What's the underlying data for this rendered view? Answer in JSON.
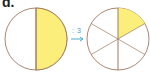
{
  "label": "d.",
  "operation": ": 3",
  "colors": {
    "fill": "#fbee7a",
    "stroke": "#a07860",
    "arrow": "#3aa6c9",
    "background": "#ffffff"
  },
  "left_circle": {
    "divisions": 2,
    "shaded": 1,
    "fraction": "1/2"
  },
  "right_circle": {
    "divisions": 6,
    "shaded": 1,
    "fraction": "1/6"
  }
}
